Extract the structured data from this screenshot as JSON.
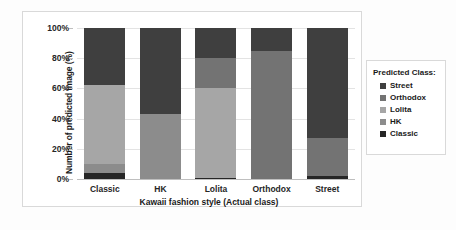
{
  "chart_data": {
    "type": "bar",
    "stacked": true,
    "stack_mode": "percent",
    "title": "",
    "xlabel": "Kawaii fashion style (Actual class)",
    "ylabel": "Number of predicted image (%)",
    "categories": [
      "Classic",
      "HK",
      "Lolita",
      "Orthodox",
      "Street"
    ],
    "ylim": [
      0,
      100
    ],
    "yticks": [
      "0%",
      "20%",
      "40%",
      "60%",
      "80%",
      "100%"
    ],
    "ytick_values": [
      0,
      20,
      40,
      60,
      80,
      100
    ],
    "grid": true,
    "legend_position": "right",
    "legend_title": "Predicted Class:",
    "series": [
      {
        "name": "Classic",
        "color": "#262626",
        "values": [
          4,
          0,
          1,
          0,
          2
        ]
      },
      {
        "name": "HK",
        "color": "#8c8c8c",
        "values": [
          6,
          43,
          0,
          0,
          0
        ]
      },
      {
        "name": "Lolita",
        "color": "#a6a6a6",
        "values": [
          52,
          0,
          59,
          0,
          0
        ]
      },
      {
        "name": "Orthodox",
        "color": "#737373",
        "values": [
          0,
          0,
          20,
          85,
          25
        ]
      },
      {
        "name": "Street",
        "color": "#3f3f3f",
        "values": [
          38,
          57,
          20,
          15,
          73
        ]
      }
    ],
    "legend_order": [
      "Street",
      "Orthodox",
      "Lolita",
      "HK",
      "Classic"
    ]
  }
}
